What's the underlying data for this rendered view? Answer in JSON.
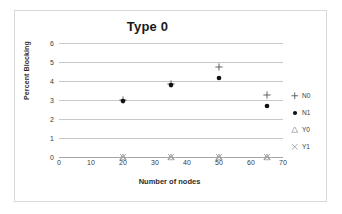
{
  "chart_data": {
    "type": "scatter",
    "title": "Type 0",
    "xlabel": "Number of nodes",
    "ylabel": "Percent Blocking",
    "xlim": [
      0,
      70
    ],
    "ylim": [
      0,
      6
    ],
    "xticks": [
      0,
      10,
      20,
      30,
      40,
      50,
      60,
      70
    ],
    "yticks": [
      0,
      1,
      2,
      3,
      4,
      5,
      6
    ],
    "grid": "horizontal",
    "legend_position": "right",
    "x": [
      20,
      35,
      50,
      65
    ],
    "series": [
      {
        "name": "N0",
        "marker": "plus",
        "color": "#4d4d4d",
        "values": [
          3.0,
          3.85,
          4.75,
          3.25
        ]
      },
      {
        "name": "N1",
        "marker": "circle",
        "color": "#111111",
        "values": [
          2.95,
          3.8,
          4.15,
          2.7
        ]
      },
      {
        "name": "Y0",
        "marker": "triangle",
        "color": "#9a9a9a",
        "values": [
          0,
          0,
          0,
          0
        ]
      },
      {
        "name": "Y1",
        "marker": "cross",
        "color": "#9a9a9a",
        "values": [
          0,
          0,
          0,
          0
        ]
      }
    ]
  },
  "legend": {
    "items": [
      {
        "label": "N0"
      },
      {
        "label": "N1"
      },
      {
        "label": "Y0"
      },
      {
        "label": "Y1"
      }
    ]
  }
}
